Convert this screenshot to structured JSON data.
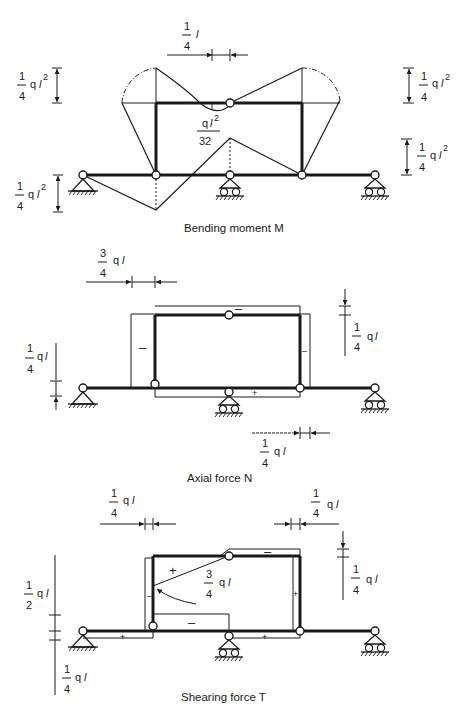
{
  "figure": {
    "colors": {
      "ink": "#1a1a1a",
      "background": "#ffffff"
    },
    "panels": [
      {
        "id": "bending",
        "caption": "Bending moment M",
        "labels": {
          "top_dim_num": "1",
          "top_dim_den": "4",
          "top_dim_unit": "l",
          "left_top_num": "1",
          "left_top_den": "4",
          "left_top_unit": "q",
          "left_bot_num": "1",
          "left_bot_den": "4",
          "left_bot_unit": "q",
          "right_top_num": "1",
          "right_top_den": "4",
          "right_top_unit": "q",
          "right_bot_num": "1",
          "right_bot_den": "4",
          "right_bot_unit": "q",
          "mid_num": "q",
          "mid_den": "32",
          "exp": "2",
          "ell": "l"
        }
      },
      {
        "id": "axial",
        "caption": "Axial force N",
        "labels": {
          "top_num": "3",
          "top_den": "4",
          "top_unit": "q",
          "left_num": "1",
          "left_den": "4",
          "left_unit": "q",
          "right_num": "1",
          "right_den": "4",
          "right_unit": "q",
          "bot_num": "1",
          "bot_den": "4",
          "bot_unit": "q",
          "ell": "l",
          "sign_left": "–",
          "sign_top": "–",
          "sign_right": "–",
          "sign_bottom": "+"
        }
      },
      {
        "id": "shear",
        "caption": "Shearing force T",
        "labels": {
          "top_left_num": "1",
          "top_left_den": "4",
          "top_left_unit": "q",
          "top_right_num": "1",
          "top_right_den": "4",
          "top_right_unit": "q",
          "left_top_num": "1",
          "left_top_den": "2",
          "left_top_unit": "q",
          "left_bot_num": "1",
          "left_bot_den": "4",
          "left_bot_unit": "q",
          "right_num": "1",
          "right_den": "4",
          "right_unit": "q",
          "mid_num": "3",
          "mid_den": "4",
          "mid_unit": "q",
          "ell": "l",
          "sign_top_plus": "+",
          "sign_top_minus": "–",
          "sign_mid_minus": "–",
          "sign_left_col": "–",
          "sign_right_col": "+",
          "sign_beam_left": "+",
          "sign_beam_right": "+"
        }
      }
    ]
  }
}
